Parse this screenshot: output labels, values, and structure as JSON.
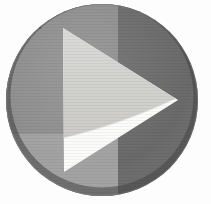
{
  "image": {
    "kind": "play-button-icon",
    "title": "Play Button",
    "alt_text": "Grayscale circular play button with right-pointing triangle",
    "background_color": "#fdfdfd",
    "width": 211,
    "height": 204,
    "texture": "horizontal scan lines"
  },
  "circle": {
    "label": "Play button disc",
    "center_x": 102,
    "center_y": 100,
    "radius_x": 96,
    "radius_y": 96,
    "bounds": {
      "left": 6,
      "top": 4,
      "right": 198,
      "bottom": 197
    },
    "regions": [
      {
        "name": "upper-left-quadrant",
        "color": "#8e8e8e"
      },
      {
        "name": "right-half",
        "color": "#6a6a6a"
      },
      {
        "name": "lower-left-band",
        "color": "#a2a2a2"
      },
      {
        "name": "bottom-shadow-rim",
        "color": "#4a4a4a"
      }
    ],
    "divider_vertical_x": 118,
    "divider_horizontal_y": 134
  },
  "triangle": {
    "label": "Play triangle",
    "points": [
      {
        "x": 63,
        "y": 28
      },
      {
        "x": 178,
        "y": 100
      },
      {
        "x": 64,
        "y": 172
      }
    ],
    "upper_fill": "#d5d5d2",
    "lower_fill": "#fbfbfa",
    "split_curve_label": "curved highlight boundary"
  },
  "accessibility": {
    "role_label": "play",
    "icon_name": "play-icon"
  }
}
